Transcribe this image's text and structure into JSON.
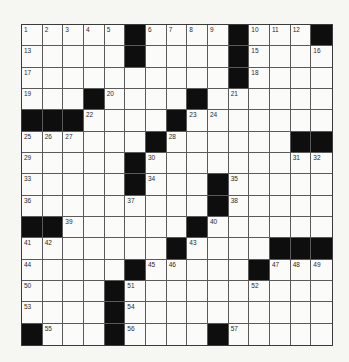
{
  "puzzle": {
    "rows": 15,
    "cols": 15,
    "colors": {
      "black_square": "#0e0e0e",
      "white_square": "#fbfbf9",
      "grid_line": "#5a5a5a",
      "number_text": "#2a2a2a",
      "background": "#f6f6f3"
    },
    "layout": [
      ".....#....#...#",
      ".....#....#....",
      "..........#....",
      "...#....#......",
      "###....#.......",
      "......#......##",
      ".....#.........",
      ".....#...#.....",
      ".........#.....",
      "##......#......",
      ".......#....###",
      ".....#.....#...",
      "....#..........",
      "....#..........",
      "#...#....#....."
    ],
    "numbers": [
      {
        "n": "1",
        "r": 0,
        "c": 0
      },
      {
        "n": "2",
        "r": 0,
        "c": 1
      },
      {
        "n": "3",
        "r": 0,
        "c": 2
      },
      {
        "n": "4",
        "r": 0,
        "c": 3
      },
      {
        "n": "5",
        "r": 0,
        "c": 4
      },
      {
        "n": "6",
        "r": 0,
        "c": 6
      },
      {
        "n": "7",
        "r": 0,
        "c": 7
      },
      {
        "n": "8",
        "r": 0,
        "c": 8
      },
      {
        "n": "9",
        "r": 0,
        "c": 9
      },
      {
        "n": "10",
        "r": 0,
        "c": 11
      },
      {
        "n": "11",
        "r": 0,
        "c": 12
      },
      {
        "n": "12",
        "r": 0,
        "c": 13
      },
      {
        "n": "13",
        "r": 1,
        "c": 0
      },
      {
        "n": "14",
        "r": 1,
        "c": 5
      },
      {
        "n": "15",
        "r": 1,
        "c": 11
      },
      {
        "n": "16",
        "r": 1,
        "c": 14
      },
      {
        "n": "17",
        "r": 2,
        "c": 0
      },
      {
        "n": "18",
        "r": 2,
        "c": 11
      },
      {
        "n": "19",
        "r": 3,
        "c": 0
      },
      {
        "n": "20",
        "r": 3,
        "c": 4
      },
      {
        "n": "21",
        "r": 3,
        "c": 10
      },
      {
        "n": "22",
        "r": 4,
        "c": 3
      },
      {
        "n": "23",
        "r": 4,
        "c": 8
      },
      {
        "n": "24",
        "r": 4,
        "c": 9
      },
      {
        "n": "25",
        "r": 5,
        "c": 0
      },
      {
        "n": "26",
        "r": 5,
        "c": 1
      },
      {
        "n": "27",
        "r": 5,
        "c": 2
      },
      {
        "n": "28",
        "r": 5,
        "c": 7
      },
      {
        "n": "29",
        "r": 6,
        "c": 0
      },
      {
        "n": "30",
        "r": 6,
        "c": 6
      },
      {
        "n": "31",
        "r": 6,
        "c": 13
      },
      {
        "n": "32",
        "r": 6,
        "c": 14
      },
      {
        "n": "33",
        "r": 7,
        "c": 0
      },
      {
        "n": "34",
        "r": 7,
        "c": 6
      },
      {
        "n": "35",
        "r": 7,
        "c": 10
      },
      {
        "n": "36",
        "r": 8,
        "c": 0
      },
      {
        "n": "37",
        "r": 8,
        "c": 5
      },
      {
        "n": "38",
        "r": 8,
        "c": 10
      },
      {
        "n": "39",
        "r": 9,
        "c": 2
      },
      {
        "n": "40",
        "r": 9,
        "c": 9
      },
      {
        "n": "41",
        "r": 10,
        "c": 0
      },
      {
        "n": "42",
        "r": 10,
        "c": 1
      },
      {
        "n": "43",
        "r": 10,
        "c": 8
      },
      {
        "n": "44",
        "r": 11,
        "c": 0
      },
      {
        "n": "45",
        "r": 11,
        "c": 6
      },
      {
        "n": "46",
        "r": 11,
        "c": 7
      },
      {
        "n": "47",
        "r": 11,
        "c": 12
      },
      {
        "n": "48",
        "r": 11,
        "c": 13
      },
      {
        "n": "49",
        "r": 11,
        "c": 14
      },
      {
        "n": "50",
        "r": 12,
        "c": 0
      },
      {
        "n": "51",
        "r": 12,
        "c": 5
      },
      {
        "n": "52",
        "r": 12,
        "c": 11
      },
      {
        "n": "53",
        "r": 13,
        "c": 0
      },
      {
        "n": "54",
        "r": 13,
        "c": 5
      },
      {
        "n": "55",
        "r": 14,
        "c": 1
      },
      {
        "n": "56",
        "r": 14,
        "c": 5
      },
      {
        "n": "57",
        "r": 14,
        "c": 10
      }
    ],
    "letters": []
  }
}
